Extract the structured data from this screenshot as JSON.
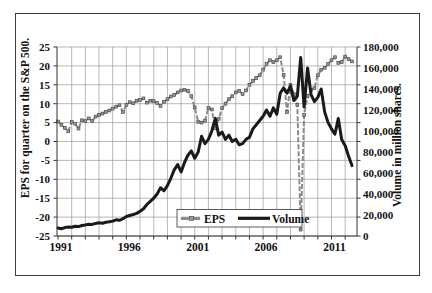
{
  "figure": {
    "background_color": "#ffffff",
    "frame_border_color": "#3c3c3c",
    "gridline_color": "#9a9a9a",
    "axis_line_color": "#333333"
  },
  "chart_data": {
    "type": "line",
    "title": "",
    "grid": "both",
    "legend_position": "inside-bottom-center",
    "x_axis": {
      "start_year": 1991,
      "frequency": "quarterly",
      "tick_labels": [
        "1991",
        "1996",
        "2001",
        "2006",
        "2011"
      ],
      "tick_every_points": 20
    },
    "left_axis": {
      "title": "EPS for quarter on the S&P 500.",
      "min": -25,
      "max": 25,
      "tick_step": 5,
      "tick_labels": [
        "25",
        "20",
        "15",
        "10",
        "5",
        "0",
        "-5",
        "-10",
        "-15",
        "-20",
        "-25"
      ]
    },
    "right_axis": {
      "title": "Volume in million shares.",
      "min": 0,
      "max": 180000,
      "tick_step": 20000,
      "tick_labels": [
        "180,000",
        "160,000",
        "140,000",
        "120,000",
        "100,000",
        "80,000",
        "60,000",
        "40,000",
        "20,000",
        "0"
      ]
    },
    "legend": {
      "eps_label": "EPS",
      "volume_label": "Volume"
    },
    "series": [
      {
        "name": "EPS",
        "axis": "left",
        "color": "#8c8c8c",
        "marker_fill": "#9a9a9a",
        "marker_stroke": "#4d4d4d",
        "style": "dashed-line-with-square-markers",
        "values": [
          5.3,
          4.4,
          3.6,
          2.7,
          5.2,
          4.7,
          3.4,
          5.6,
          5.4,
          6.1,
          5.4,
          6.6,
          7.0,
          7.4,
          7.8,
          8.2,
          8.7,
          9.2,
          9.6,
          7.8,
          9.7,
          10.4,
          10.1,
          10.8,
          11.0,
          11.4,
          10.3,
          10.8,
          10.7,
          10.2,
          9.4,
          10.5,
          11.2,
          11.9,
          12.3,
          13.0,
          13.5,
          13.7,
          13.4,
          12.0,
          9.0,
          5.2,
          5.0,
          5.5,
          8.9,
          8.5,
          3.5,
          6.0,
          8.8,
          10.0,
          11.2,
          12.0,
          13.0,
          13.4,
          12.5,
          13.5,
          15.0,
          16.0,
          16.8,
          17.5,
          19.0,
          20.5,
          21.5,
          21.0,
          21.5,
          22.3,
          17.6,
          7.8,
          15.0,
          12.5,
          9.7,
          -23.3,
          7.0,
          12.0,
          13.6,
          14.1,
          17.5,
          19.0,
          19.5,
          20.5,
          21.5,
          22.3,
          20.8,
          21.0,
          22.5,
          21.8,
          21.2
        ]
      },
      {
        "name": "Volume",
        "axis": "right",
        "color": "#1a1a1a",
        "style": "solid-thick-line",
        "values": [
          7500,
          7000,
          8000,
          8600,
          8300,
          9200,
          9000,
          10000,
          10600,
          11200,
          11000,
          12000,
          12600,
          12200,
          13000,
          13500,
          14200,
          15400,
          15000,
          16500,
          18600,
          19500,
          20500,
          21500,
          23400,
          26000,
          30000,
          33000,
          36000,
          40000,
          46000,
          43000,
          48000,
          55000,
          63000,
          68000,
          61000,
          70000,
          77000,
          81000,
          74000,
          80000,
          95000,
          88000,
          92000,
          100000,
          112000,
          96000,
          99000,
          92000,
          96000,
          90000,
          92000,
          87000,
          88000,
          92000,
          94000,
          102000,
          106000,
          110000,
          114000,
          120000,
          114000,
          122000,
          116000,
          136000,
          141000,
          136000,
          143000,
          129000,
          133000,
          170000,
          123000,
          160000,
          135000,
          128000,
          132000,
          140000,
          118000,
          108000,
          102000,
          97000,
          112000,
          92000,
          86000,
          76000,
          67000
        ]
      }
    ]
  }
}
